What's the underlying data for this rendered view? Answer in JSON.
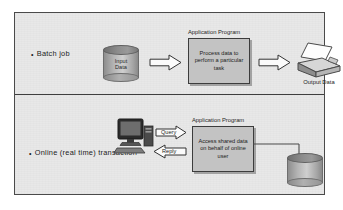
{
  "diagram": {
    "rows": [
      {
        "id": "batch",
        "label": "Batch job",
        "bullet": "•",
        "source": {
          "name": "input-data-cylinder",
          "label_line1": "Input",
          "label_line2": "Data"
        },
        "program": {
          "title": "Application Program",
          "body": "Process data to perform a particular task"
        },
        "output": {
          "name": "printer",
          "label": "Output Data"
        },
        "arrows": [
          {
            "name": "arrow-input-to-program",
            "direction": "right",
            "caption": ""
          },
          {
            "name": "arrow-program-to-output",
            "direction": "right",
            "caption": ""
          }
        ]
      },
      {
        "id": "online",
        "label": "Online (real time) transaction",
        "bullet": "•",
        "client": {
          "name": "desktop-computer"
        },
        "program": {
          "title": "Application Program",
          "body": "Access shared data on behalf of online user"
        },
        "store": {
          "name": "shared-data-cylinder",
          "label_line1": "",
          "label_line2": ""
        },
        "arrows": [
          {
            "name": "arrow-query",
            "direction": "right",
            "caption": "Query"
          },
          {
            "name": "arrow-reply",
            "direction": "left",
            "caption": "Reply"
          }
        ]
      }
    ],
    "colors": {
      "panel_background": "#e8e8e8",
      "panel_border": "#4a4a4a",
      "box_fill": "#c3c3c3",
      "box_border": "#3c3c3c",
      "arrow_fill": "#fbfbfb",
      "arrow_border": "#333333",
      "text": "#1c1c1c"
    }
  }
}
